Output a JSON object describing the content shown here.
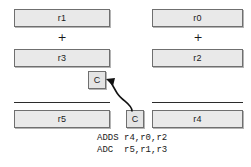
{
  "diagram": {
    "operands": {
      "high_word": {
        "row1": "r1",
        "row2": "r3",
        "result": "r5"
      },
      "low_word": {
        "row1": "r0",
        "row2": "r2",
        "result": "r4"
      }
    },
    "boxes": [
      {
        "id": "box-r1",
        "label": "r1",
        "column": "high",
        "row": "operand-1",
        "x": 14,
        "y": 9,
        "w": 96,
        "h": 18
      },
      {
        "id": "box-r0",
        "label": "r0",
        "column": "low",
        "row": "operand-1",
        "x": 152,
        "y": 9,
        "w": 91,
        "h": 18
      },
      {
        "id": "box-r3",
        "label": "r3",
        "column": "high",
        "row": "operand-2",
        "x": 14,
        "y": 49,
        "w": 96,
        "h": 18
      },
      {
        "id": "box-r2",
        "label": "r2",
        "column": "low",
        "row": "operand-2",
        "x": 152,
        "y": 49,
        "w": 91,
        "h": 18
      },
      {
        "id": "box-r5",
        "label": "r5",
        "column": "high",
        "row": "result",
        "x": 14,
        "y": 110,
        "w": 96,
        "h": 18
      },
      {
        "id": "box-r4",
        "label": "r4",
        "column": "low",
        "row": "result",
        "x": 152,
        "y": 110,
        "w": 91,
        "h": 18
      }
    ],
    "carry_boxes": [
      {
        "id": "carry-in",
        "label": "C",
        "x": 88,
        "y": 71,
        "w": 18,
        "h": 18
      },
      {
        "id": "carry-out",
        "label": "C",
        "x": 126,
        "y": 110,
        "w": 18,
        "h": 18
      }
    ],
    "plus_signs": [
      {
        "id": "plus-high",
        "label": "+",
        "x": 56,
        "y": 32
      },
      {
        "id": "plus-low",
        "label": "+",
        "x": 192,
        "y": 32
      }
    ],
    "sum_rules": [
      {
        "id": "sum-rule-high",
        "x": 14,
        "y": 102,
        "w": 96
      },
      {
        "id": "sum-rule-low",
        "x": 152,
        "y": 102,
        "w": 91
      }
    ],
    "carry_arrow": {
      "description": "carry-out of low word feeds carry-in of high word",
      "path": "M 133 110 C 133 100, 120 100, 116 92 C 113 87, 111 83, 108 80",
      "color": "#111111"
    }
  },
  "code": {
    "line1": "ADDS r4,r0,r2",
    "line2": "ADC  r5,r1,r3",
    "x": 97,
    "y1": 138,
    "y2": 150
  },
  "colors": {
    "box_fill": "#e9e9e9",
    "box_border": "#6f6f6f",
    "text": "#1a1a1a",
    "rule": "#2b2b2b",
    "background": "#ffffff"
  }
}
